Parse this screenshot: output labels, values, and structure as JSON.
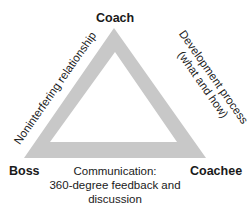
{
  "diagram": {
    "nodes": {
      "top": "Coach",
      "left": "Boss",
      "right": "Coachee"
    },
    "edges": {
      "left": "Noninterfering relationship",
      "right_line1": "Development process",
      "right_line2": "(what and how)",
      "bottom_line1": "Communication:",
      "bottom_line2": "360-degree feedback and",
      "bottom_line3": "discussion"
    },
    "colors": {
      "triangle": "#c8c8c8",
      "text": "#1a1a1a"
    }
  }
}
